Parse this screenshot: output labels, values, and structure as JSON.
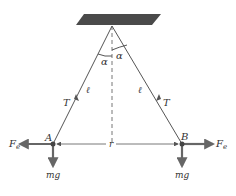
{
  "diagram": {
    "title": "",
    "colors": {
      "ceiling": "#4a4a4a",
      "line": "#555555",
      "force_arrow": "#666666",
      "text": "#333333",
      "background": "#ffffff"
    },
    "labels": {
      "alpha_left": "α",
      "alpha_right": "α",
      "length_left": "ℓ",
      "length_right": "ℓ",
      "tension_left": "T",
      "tension_right": "T",
      "point_a": "A",
      "point_b": "B",
      "separation": "r",
      "fe_left_main": "F",
      "fe_left_sub": "e",
      "fe_right_main": "F",
      "fe_right_sub": "e",
      "mg_left": "mg",
      "mg_right": "mg"
    }
  }
}
